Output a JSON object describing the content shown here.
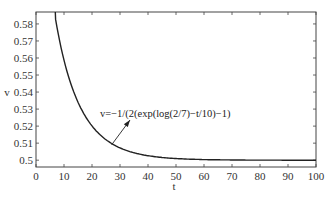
{
  "chart_data": {
    "type": "line",
    "title": "",
    "xlabel": "t",
    "ylabel": "v",
    "xlim": [
      0,
      100
    ],
    "ylim": [
      0.496,
      0.587
    ],
    "x_ticks": [
      "0",
      "10",
      "20",
      "30",
      "40",
      "50",
      "60",
      "70",
      "80",
      "90",
      "100"
    ],
    "y_ticks": [
      "0.5",
      "0.51",
      "0.52",
      "0.53",
      "0.54",
      "0.55",
      "0.56",
      "0.57",
      "0.58"
    ],
    "grid": false,
    "series": [
      {
        "name": "v=-1/(2(exp(log(2/7)-t/10)-1)",
        "x": [
          7,
          10,
          15,
          20,
          25,
          30,
          35,
          40,
          50,
          60,
          70,
          80,
          90,
          100
        ],
        "values": [
          0.583,
          0.559,
          0.534,
          0.52,
          0.512,
          0.507,
          0.504,
          0.503,
          0.501,
          0.5,
          0.5,
          0.5,
          0.5,
          0.5
        ]
      }
    ],
    "annotations": [
      {
        "text": "v=-1/(2(exp(log(2/7)-t/10)-1)",
        "arrow_to": [
          27,
          0.509
        ]
      }
    ]
  },
  "labels": {
    "xlabel": "t",
    "ylabel": "v",
    "annotation": "v=−1/(2(exp(log(2/7)−t/10)−1)"
  }
}
